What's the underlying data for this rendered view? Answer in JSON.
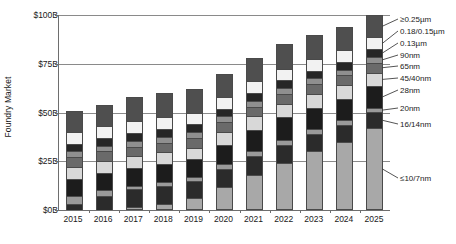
{
  "chart_data": {
    "type": "bar",
    "subtype": "stacked-column",
    "title": "",
    "xlabel": "",
    "ylabel": "Foundry Market",
    "ylim": [
      0,
      100
    ],
    "yunit": "$B",
    "grid": true,
    "legend_position": "right",
    "categories": [
      "2015",
      "2016",
      "2017",
      "2018",
      "2019",
      "2020",
      "2021",
      "2022",
      "2023",
      "2024",
      "2025"
    ],
    "ytick_labels": [
      "$0B",
      "$25B",
      "$50B",
      "$75B",
      "$100B"
    ],
    "ytick_values": [
      0,
      25,
      50,
      75,
      100
    ],
    "totals": [
      51,
      54,
      58,
      60,
      62,
      70,
      78,
      85,
      90,
      94,
      100
    ],
    "series": [
      {
        "name": "≤10/7nm",
        "color": "#a8a8a8",
        "values": [
          0.0,
          0.0,
          1.5,
          3.0,
          6.0,
          12.0,
          18.0,
          24.0,
          30.0,
          35.0,
          42.0
        ]
      },
      {
        "name": "16/14nm",
        "color": "#2b2b2b",
        "values": [
          3.0,
          7.0,
          9.0,
          9.5,
          9.0,
          9.0,
          9.5,
          9.5,
          9.0,
          8.5,
          8.0
        ]
      },
      {
        "name": "20nm",
        "color": "#9a9a9a",
        "values": [
          4.0,
          3.0,
          2.0,
          2.0,
          2.0,
          2.5,
          2.5,
          2.5,
          2.5,
          2.5,
          2.5
        ]
      },
      {
        "name": "28nm",
        "color": "#1c1c1c",
        "values": [
          9.0,
          9.0,
          9.0,
          9.0,
          9.0,
          10.0,
          11.0,
          11.5,
          11.0,
          11.0,
          11.0
        ]
      },
      {
        "name": "45/40nm",
        "color": "#d8d8d8",
        "values": [
          6.0,
          6.0,
          6.0,
          6.0,
          6.0,
          6.5,
          7.0,
          7.0,
          7.0,
          7.0,
          7.0
        ]
      },
      {
        "name": "65nm",
        "color": "#6a6a6a",
        "values": [
          5.0,
          5.0,
          5.0,
          5.0,
          5.0,
          5.0,
          5.0,
          5.0,
          5.0,
          5.0,
          5.0
        ]
      },
      {
        "name": "90nm",
        "color": "#8f8f8f",
        "values": [
          3.0,
          3.0,
          3.0,
          3.0,
          3.0,
          3.0,
          3.0,
          3.0,
          3.0,
          3.0,
          3.0
        ]
      },
      {
        "name": "0.13µm",
        "color": "#262626",
        "values": [
          4.0,
          4.0,
          4.0,
          4.0,
          4.0,
          4.0,
          4.0,
          4.0,
          4.0,
          4.0,
          4.0
        ]
      },
      {
        "name": "0.18/0.15µm",
        "color": "#f2f2f2",
        "values": [
          6.0,
          6.0,
          6.0,
          6.0,
          6.0,
          6.0,
          6.0,
          6.0,
          6.0,
          6.0,
          6.0
        ]
      },
      {
        "name": "≥0.25µm",
        "color": "#4f4f4f",
        "values": [
          11.0,
          11.0,
          12.5,
          12.5,
          12.0,
          12.0,
          12.0,
          12.5,
          12.5,
          12.0,
          11.5
        ]
      }
    ],
    "legend_entries": [
      "≥0.25µm",
      "0.18/0.15µm",
      "0.13µm",
      "90nm",
      "65nm",
      "45/40nm",
      "28nm",
      "20nm",
      "16/14nm",
      "≤10/7nm"
    ]
  }
}
